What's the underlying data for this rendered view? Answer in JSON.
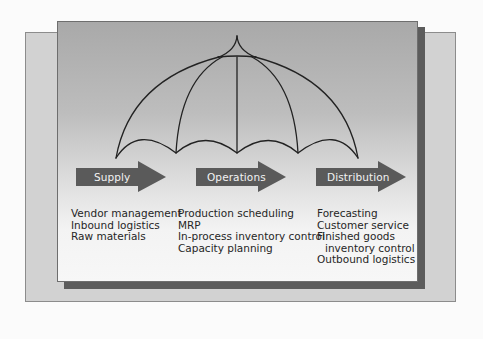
{
  "diagram": {
    "type": "umbrella",
    "colors": {
      "page_background": "#fbfbfb",
      "outer_frame": "#d2d2d2",
      "panel_top": "#a9a9a9",
      "panel_bottom": "#f7f7f7",
      "shadow": "#5c5c5c",
      "arrow_fill": "#5a5a5a",
      "line": "#222222",
      "text": "#262626"
    }
  },
  "stages": [
    {
      "label": "Supply",
      "items": [
        "Vendor management",
        "Inbound logistics",
        "Raw materials"
      ]
    },
    {
      "label": "Operations",
      "items": [
        "Production scheduling",
        "MRP",
        "In-process inventory control",
        "Capacity planning"
      ]
    },
    {
      "label": "Distribution",
      "items": [
        "Forecasting",
        "Customer service",
        "Finished goods",
        "inventory control",
        "Outbound logistics"
      ]
    }
  ]
}
